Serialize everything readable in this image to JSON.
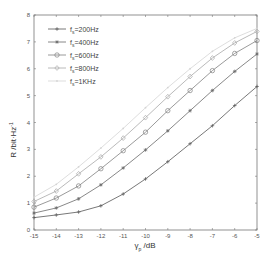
{
  "chart_data": {
    "type": "line",
    "title": "",
    "xlabel": "γ_p /dB",
    "ylabel": "R /bit·Hz⁻¹",
    "xlim": [
      -15,
      -5
    ],
    "ylim": [
      0,
      8
    ],
    "grid": false,
    "legend_position": "upper left",
    "x": [
      -15,
      -14,
      -13,
      -12,
      -11,
      -10,
      -9,
      -8,
      -7,
      -6,
      -5
    ],
    "x_tick_labels": [
      "-15",
      "-14",
      "-13",
      "-12",
      "-11",
      "-10",
      "-9",
      "-8",
      "-7",
      "-6",
      "-5"
    ],
    "y_tick_labels": [
      "0",
      "1",
      "2",
      "3",
      "4",
      "5",
      "6",
      "7",
      "8"
    ],
    "series": [
      {
        "name": "f_s=200Hz",
        "marker": "plus",
        "color": "#555555",
        "values": [
          0.46,
          0.56,
          0.67,
          0.9,
          1.34,
          1.9,
          2.54,
          3.21,
          3.88,
          4.63,
          5.34
        ]
      },
      {
        "name": "f_s=400Hz",
        "marker": "star",
        "color": "#6a6a6a",
        "values": [
          0.63,
          0.82,
          1.16,
          1.68,
          2.31,
          2.98,
          3.69,
          4.44,
          5.19,
          5.9,
          6.55
        ]
      },
      {
        "name": "f_s=600Hz",
        "marker": "circle",
        "color": "#808080",
        "values": [
          0.85,
          1.19,
          1.64,
          2.28,
          2.95,
          3.64,
          4.44,
          5.19,
          5.93,
          6.57,
          7.05
        ]
      },
      {
        "name": "f_s=800Hz",
        "marker": "diamond",
        "color": "#a8a8a8",
        "values": [
          1.06,
          1.45,
          2.09,
          2.72,
          3.42,
          4.18,
          4.96,
          5.71,
          6.4,
          6.96,
          7.39
        ]
      },
      {
        "name": "f_s=1KHz",
        "marker": "dot",
        "color": "#d4d4d4",
        "values": [
          1.22,
          1.7,
          2.35,
          3.05,
          3.78,
          4.55,
          5.3,
          6.0,
          6.65,
          7.15,
          7.5
        ]
      }
    ]
  },
  "legend": {
    "items": [
      {
        "prefix": "f",
        "sub": "s",
        "suffix": "=200Hz"
      },
      {
        "prefix": "f",
        "sub": "s",
        "suffix": "=400Hz"
      },
      {
        "prefix": "f",
        "sub": "s",
        "suffix": "=600Hz"
      },
      {
        "prefix": "f",
        "sub": "s",
        "suffix": "=800Hz"
      },
      {
        "prefix": "f",
        "sub": "s",
        "suffix": "=1KHz"
      }
    ]
  },
  "axes": {
    "ylabel_main": "R /bit·Hz",
    "ylabel_sup": "-1",
    "xlabel_main": "γ",
    "xlabel_sub": "p",
    "xlabel_unit": " /dB"
  }
}
